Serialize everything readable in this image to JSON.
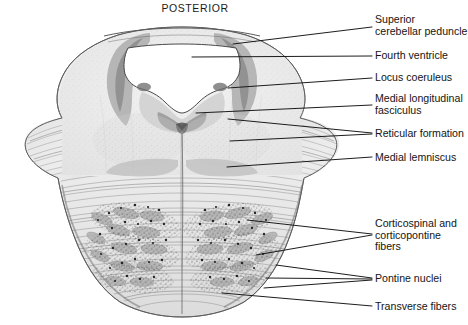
{
  "figure": {
    "orientation_title": "POSTERIOR",
    "background_color": "#ffffff",
    "ink_color": "#141414"
  },
  "labels": [
    {
      "id": "superior-cerebellar-peduncle",
      "text": "Superior\ncerebellar peduncle",
      "x": 375,
      "y": 14,
      "leader_from": [
        372,
        27
      ],
      "leader_to": [
        233,
        44
      ]
    },
    {
      "id": "fourth-ventricle",
      "text": "Fourth ventricle",
      "x": 375,
      "y": 50,
      "leader_from": [
        372,
        56
      ],
      "leader_to": [
        192,
        57
      ]
    },
    {
      "id": "locus-coeruleus",
      "text": "Locus coeruleus",
      "x": 375,
      "y": 72,
      "leader_from": [
        372,
        78
      ],
      "leader_to": [
        228,
        88
      ]
    },
    {
      "id": "medial-longitudinal-fasciculus",
      "text": "Medial longitudinal\nfasciculus",
      "x": 375,
      "y": 93,
      "leader_from": [
        372,
        105
      ],
      "leader_to": [
        196,
        113
      ]
    },
    {
      "id": "reticular-formation",
      "text": "Reticular formation",
      "x": 375,
      "y": 128,
      "leader_from": [
        372,
        133
      ],
      "leader_to": [
        228,
        119
      ]
    },
    {
      "id": "reticular-formation-second",
      "text": "",
      "x": 375,
      "y": 128,
      "leader_from": [
        372,
        134
      ],
      "leader_to": [
        230,
        141
      ]
    },
    {
      "id": "medial-lemniscus",
      "text": "Medial lemniscus",
      "x": 375,
      "y": 152,
      "leader_from": [
        372,
        157
      ],
      "leader_to": [
        227,
        167
      ]
    },
    {
      "id": "corticospinal-and-corticopontine-fibers",
      "text": "Corticospinal and\ncorticopontine\nfibers",
      "x": 375,
      "y": 218,
      "leader_from": [
        372,
        234
      ],
      "leader_to": [
        247,
        220
      ]
    },
    {
      "id": "corticospinal-second-leader",
      "text": "",
      "x": 375,
      "y": 218,
      "leader_from": [
        372,
        235
      ],
      "leader_to": [
        256,
        255
      ]
    },
    {
      "id": "pontine-nuclei",
      "text": "Pontine nuclei",
      "x": 375,
      "y": 273,
      "leader_from": [
        372,
        278
      ],
      "leader_to": [
        276,
        265
      ]
    },
    {
      "id": "pontine-nuclei-second-leader",
      "text": "",
      "x": 375,
      "y": 273,
      "leader_from": [
        372,
        279
      ],
      "leader_to": [
        266,
        278
      ]
    },
    {
      "id": "pontine-nuclei-third-leader",
      "text": "",
      "x": 375,
      "y": 273,
      "leader_from": [
        372,
        280
      ],
      "leader_to": [
        264,
        288
      ]
    },
    {
      "id": "transverse-fibers",
      "text": "Transverse fibers",
      "x": 375,
      "y": 301,
      "leader_from": [
        372,
        306
      ],
      "leader_to": [
        222,
        293
      ]
    }
  ]
}
